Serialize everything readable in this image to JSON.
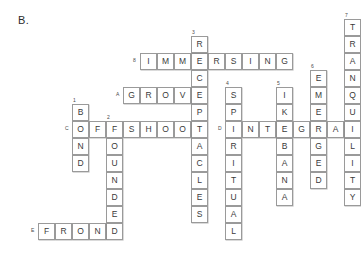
{
  "puzzle": {
    "label": "B.",
    "cell_size": 17,
    "origin": {
      "x": 21,
      "y": 19
    },
    "colors": {
      "cell_border": "#9a9a9a",
      "cell_fill": "#ffffff",
      "letter": "#3a3a3a",
      "clue_number": "#4a4a4a",
      "page_background": "#ffffff"
    },
    "entries": [
      {
        "id": "entry-tranquility",
        "answer": "TRANQUILITY",
        "clue_marker": "7",
        "direction": "down",
        "marker_position": "above",
        "start": {
          "col": 19,
          "row": 0
        },
        "letters": [
          "T",
          "R",
          "A",
          "N",
          "Q",
          "U",
          "I",
          "L",
          "I",
          "T",
          "Y"
        ]
      },
      {
        "id": "entry-immersing",
        "answer": "IMMERSING",
        "clue_marker": "8",
        "direction": "across",
        "marker_position": "left",
        "start": {
          "col": 7,
          "row": 2
        },
        "letters": [
          "I",
          "M",
          "M",
          "E",
          "R",
          "S",
          "I",
          "N",
          "G"
        ]
      },
      {
        "id": "entry-receptacles",
        "answer": "RECEPTACLES",
        "clue_marker": "3",
        "direction": "down",
        "marker_position": "above",
        "start": {
          "col": 10,
          "row": 1
        },
        "letters": [
          "R",
          "E",
          "C",
          "E",
          "P",
          "T",
          "A",
          "C",
          "L",
          "E",
          "S"
        ]
      },
      {
        "id": "entry-grove",
        "answer": "GROVE",
        "clue_marker": "A",
        "direction": "across",
        "marker_position": "left",
        "start": {
          "col": 6,
          "row": 4
        },
        "letters": [
          "G",
          "R",
          "O",
          "V",
          "E"
        ]
      },
      {
        "id": "entry-emerged",
        "answer": "EMERGED",
        "clue_marker": "6",
        "direction": "down",
        "marker_position": "above",
        "start": {
          "col": 17,
          "row": 3
        },
        "letters": [
          "E",
          "M",
          "E",
          "R",
          "G",
          "E",
          "D"
        ]
      },
      {
        "id": "entry-spiritual",
        "answer": "SPIRITUAL",
        "clue_marker": "4",
        "direction": "down",
        "marker_position": "above",
        "start": {
          "col": 12,
          "row": 4
        },
        "letters": [
          "S",
          "P",
          "I",
          "R",
          "I",
          "T",
          "U",
          "A",
          "L"
        ]
      },
      {
        "id": "entry-ikebana",
        "answer": "IKEBANA",
        "clue_marker": "5",
        "direction": "down",
        "marker_position": "above",
        "start": {
          "col": 15,
          "row": 4
        },
        "letters": [
          "I",
          "K",
          "E",
          "B",
          "A",
          "N",
          "A"
        ]
      },
      {
        "id": "entry-bond",
        "answer": "BOND",
        "clue_marker": "1",
        "direction": "down",
        "marker_position": "above",
        "start": {
          "col": 3,
          "row": 5
        },
        "letters": [
          "B",
          "O",
          "N",
          "D"
        ]
      },
      {
        "id": "entry-offshoot",
        "answer": "OFFSHOOT",
        "clue_marker": "C",
        "direction": "across",
        "marker_position": "left",
        "start": {
          "col": 3,
          "row": 6
        },
        "letters": [
          "O",
          "F",
          "F",
          "S",
          "H",
          "O",
          "O",
          "T"
        ]
      },
      {
        "id": "entry-founded",
        "answer": "FOUNDED",
        "clue_marker": "2",
        "direction": "down",
        "marker_position": "above",
        "start": {
          "col": 5,
          "row": 6
        },
        "letters": [
          "F",
          "O",
          "U",
          "N",
          "D",
          "E",
          "D"
        ]
      },
      {
        "id": "entry-integral",
        "answer": "INTEGRAL",
        "clue_marker": "D",
        "direction": "across",
        "marker_position": "left",
        "start": {
          "col": 12,
          "row": 6
        },
        "letters": [
          "I",
          "N",
          "T",
          "E",
          "G",
          "R",
          "A",
          "L"
        ]
      },
      {
        "id": "entry-frond",
        "answer": "FROND",
        "clue_marker": "E",
        "direction": "across",
        "marker_position": "left",
        "start": {
          "col": 1,
          "row": 12
        },
        "letters": [
          "F",
          "R",
          "O",
          "N",
          "D"
        ]
      }
    ]
  }
}
